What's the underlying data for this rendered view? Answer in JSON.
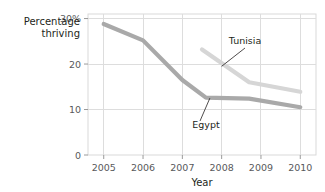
{
  "chart_data": {
    "type": "line",
    "title": "",
    "xlabel": "Year",
    "ylabel_line1": "Percentage",
    "ylabel_line2": "thriving",
    "x": [
      2005,
      2006,
      2007,
      2008,
      2009,
      2010
    ],
    "xlim": [
      2004.6,
      2010.4
    ],
    "ylim": [
      0,
      31
    ],
    "xtick_labels": [
      "2005",
      "2006",
      "2007",
      "2008",
      "2009",
      "2010"
    ],
    "ytick_values": [
      0,
      10,
      20,
      30
    ],
    "ytick_labels": [
      "0",
      "10",
      "20",
      "30%"
    ],
    "grid": true,
    "legend_position": "inline-annotations",
    "series": [
      {
        "name": "Egypt",
        "color": "#a9a9a9",
        "x": [
          2005,
          2006,
          2007,
          2007.6,
          2008.7,
          2010
        ],
        "values": [
          28.8,
          25.2,
          16.5,
          12.6,
          12.4,
          10.5
        ],
        "label": "Egypt"
      },
      {
        "name": "Tunisia",
        "color": "#d6d6d6",
        "x": [
          2007.5,
          2008.7,
          2010
        ],
        "values": [
          23.2,
          16.0,
          13.9
        ],
        "label": "Tunisia"
      }
    ],
    "annotations": [
      {
        "text": "Tunisia",
        "target_x": 2008.0,
        "target_y": 19.5
      },
      {
        "text": "Egypt",
        "target_x": 2007.7,
        "target_y": 12.5
      }
    ]
  }
}
